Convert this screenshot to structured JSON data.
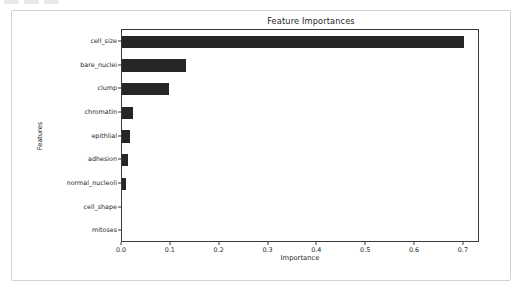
{
  "toolbar": {
    "visible_fragment": true,
    "chip_count": 3
  },
  "figure": {
    "background_color": "#ffffff",
    "border_color": "#d2d2d6"
  },
  "chart_data": {
    "type": "bar",
    "orientation": "horizontal",
    "title": "Feature Importances",
    "xlabel": "Importance",
    "ylabel": "Features",
    "categories": [
      "cell_size",
      "bare_nuclei",
      "clump",
      "chromatin",
      "epithlial",
      "adhesion",
      "normal_nucleoli",
      "cell_shape",
      "mitoses"
    ],
    "values": [
      0.701,
      0.131,
      0.096,
      0.022,
      0.017,
      0.013,
      0.009,
      0.0,
      0.0
    ],
    "xlim": [
      0.0,
      0.733
    ],
    "xticks": [
      0.0,
      0.1,
      0.2,
      0.3,
      0.4,
      0.5,
      0.6,
      0.7
    ],
    "xticklabels": [
      "0.0",
      "0.1",
      "0.2",
      "0.3",
      "0.4",
      "0.5",
      "0.6",
      "0.7"
    ],
    "grid": false,
    "legend": null,
    "bar_color": "#262626",
    "axis_color": "#3a3a3a"
  }
}
